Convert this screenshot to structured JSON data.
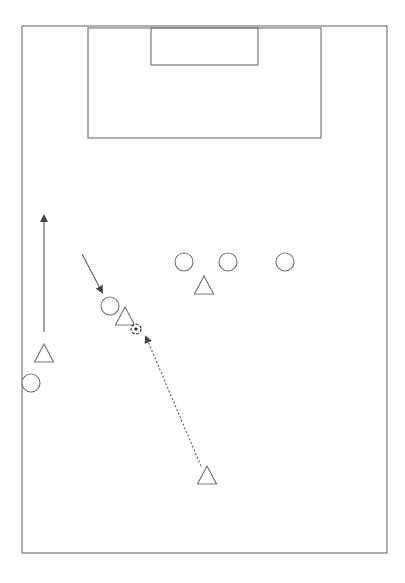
{
  "diagram": {
    "colors": {
      "line": "#7a7a7a",
      "background": "#ffffff"
    },
    "pitch": {
      "x1": 22,
      "y1": 26,
      "x2": 387,
      "y2": 553
    },
    "penalty_box": {
      "x1": 88,
      "y1": 28,
      "x2": 321,
      "y2": 138
    },
    "goal_box": {
      "x1": 151,
      "y1": 28,
      "x2": 258,
      "y2": 65
    },
    "legend": {
      "circle": "player (team A)",
      "triangle": "player (team B)",
      "ball": "ball",
      "solid_arrow": "player run",
      "dashed_arrow": "pass"
    },
    "players_circles": [
      {
        "cx": 184,
        "cy": 262
      },
      {
        "cx": 228,
        "cy": 262
      },
      {
        "cx": 285,
        "cy": 262
      },
      {
        "cx": 110,
        "cy": 306
      },
      {
        "cx": 31,
        "cy": 383
      }
    ],
    "players_triangles": [
      {
        "cx": 204,
        "cy": 285
      },
      {
        "cx": 125,
        "cy": 316
      },
      {
        "cx": 44,
        "cy": 353
      },
      {
        "cx": 207,
        "cy": 475
      }
    ],
    "ball": {
      "cx": 136,
      "cy": 329
    },
    "runs": [
      {
        "x1": 44,
        "y1": 332,
        "x2": 44,
        "y2": 216,
        "style": "solid"
      },
      {
        "x1": 82,
        "y1": 254,
        "x2": 102,
        "y2": 292,
        "style": "solid"
      }
    ],
    "passes": [
      {
        "x1": 201,
        "y1": 466,
        "x2": 146,
        "y2": 337,
        "style": "dashed"
      }
    ]
  }
}
